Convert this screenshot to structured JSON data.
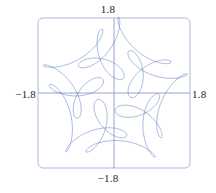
{
  "figure": {
    "name": "parametric-curve-plot",
    "labels": {
      "top": "1.8",
      "bottom": "−1.8",
      "left": "−1.8",
      "right": "1.8"
    },
    "colors": {
      "curve": "#3f63bd",
      "frame": "#aab9dd",
      "axis": "#8e9cc4",
      "background": "#ffffff",
      "text": "#1c1c1c"
    }
  },
  "chart_data": {
    "type": "line",
    "title": "",
    "xlabel": "",
    "ylabel": "",
    "xlim": [
      -1.8,
      1.8
    ],
    "ylim": [
      -1.8,
      1.8
    ],
    "grid": false,
    "legend": null,
    "axis_tick_labels": {
      "x": [
        "−1.8",
        "1.8"
      ],
      "y": [
        "−1.8",
        "1.8"
      ]
    },
    "frame": {
      "visible": true,
      "rounded": true,
      "x_range": [
        -1.8,
        1.8
      ],
      "y_range": [
        -1.8,
        1.8
      ]
    },
    "axes_through_origin": true,
    "parametric": {
      "x": "cos(t) + cos(6t)/2 + sin(14t)/3",
      "y": "sin(t) + sin(6t)/2 + cos(14t)/3",
      "t_range": [
        0,
        6.283185307179586
      ],
      "samples": 2400
    },
    "series": [
      {
        "name": "curve",
        "color": "#3f63bd",
        "linewidth": 0.45
      }
    ]
  },
  "plot_geometry": {
    "frame_px": {
      "left": 38,
      "top": 18,
      "right": 190,
      "bottom": 168,
      "corner_radius": 5
    },
    "origin_px": {
      "x": 114,
      "y": 93
    },
    "scale_px_per_unit": 42.2
  }
}
